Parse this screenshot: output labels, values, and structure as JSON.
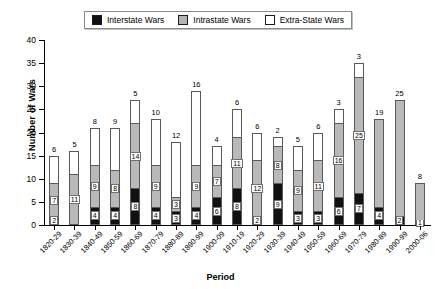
{
  "chart_data": {
    "type": "bar",
    "stacked": true,
    "title": "",
    "xlabel": "Period",
    "ylabel": "Number of Wars",
    "ylim": [
      0,
      40
    ],
    "yticks": [
      0,
      5,
      10,
      15,
      20,
      25,
      30,
      35,
      40
    ],
    "grid": false,
    "legend_position": "top-center",
    "categories": [
      "1820-29",
      "1830-39",
      "1840-49",
      "1850-59",
      "1860-69",
      "1870-79",
      "1880-89",
      "1890-99",
      "1900-09",
      "1910-19",
      "1920-29",
      "1930-39",
      "1940-49",
      "1950-59",
      "1960-69",
      "1970-79",
      "1980-89",
      "1990-99",
      "2000-06"
    ],
    "series": [
      {
        "name": "Interstate Wars",
        "color": "#111111",
        "values": [
          2,
          0,
          4,
          4,
          8,
          4,
          3,
          4,
          6,
          8,
          2,
          9,
          3,
          3,
          6,
          7,
          4,
          2,
          1
        ]
      },
      {
        "name": "Intrastate Wars",
        "color": "#b9b9b9",
        "values": [
          7,
          11,
          9,
          8,
          14,
          9,
          3,
          9,
          7,
          11,
          12,
          8,
          9,
          11,
          16,
          25,
          19,
          25,
          8
        ]
      },
      {
        "name": "Extra-State Wars",
        "color": "#ffffff",
        "values": [
          6,
          5,
          8,
          9,
          5,
          10,
          12,
          16,
          4,
          6,
          6,
          2,
          5,
          6,
          3,
          3,
          0,
          0,
          0
        ]
      }
    ],
    "totals": [
      15,
      16,
      21,
      21,
      27,
      23,
      18,
      29,
      17,
      25,
      20,
      19,
      17,
      20,
      25,
      35,
      23,
      27,
      9
    ]
  },
  "legend": {
    "items": [
      {
        "label": "Interstate Wars",
        "swatch": "black-square-icon"
      },
      {
        "label": "Intrastate Wars",
        "swatch": "gray-square-icon"
      },
      {
        "label": "Extra-State Wars",
        "swatch": "white-square-icon"
      }
    ]
  },
  "axes": {
    "y_title": "Number of Wars",
    "x_title": "Period"
  }
}
